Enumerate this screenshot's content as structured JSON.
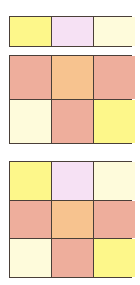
{
  "colors": {
    "yellow": "#fdf78a",
    "lavender": "#f6e1f4",
    "cream": "#fefbdb",
    "salmon": "#eeae9c",
    "peach": "#f7c38f",
    "border": "#4a3f38"
  },
  "grids": [
    {
      "name": "grid-1x3",
      "rows": [
        [
          "yellow",
          "lavender",
          "cream"
        ]
      ]
    },
    {
      "name": "grid-2x3",
      "rows": [
        [
          "salmon",
          "peach",
          "salmon"
        ],
        [
          "cream",
          "salmon",
          "yellow"
        ]
      ]
    },
    {
      "name": "grid-3x3",
      "rows": [
        [
          "yellow",
          "lavender",
          "cream"
        ],
        [
          "salmon",
          "peach",
          "salmon"
        ],
        [
          "cream",
          "salmon",
          "yellow"
        ]
      ]
    }
  ]
}
